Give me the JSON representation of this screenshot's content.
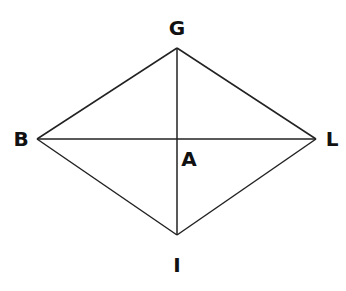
{
  "diagram": {
    "stroke_color": "#222222",
    "points": {
      "G": {
        "label": "G",
        "x": 177,
        "y": 48,
        "label_x": 177,
        "label_y": 35
      },
      "B": {
        "label": "B",
        "x": 37,
        "y": 139,
        "label_x": 21,
        "label_y": 146
      },
      "L": {
        "label": "L",
        "x": 316,
        "y": 139,
        "label_x": 332,
        "label_y": 146
      },
      "I": {
        "label": "I",
        "x": 177,
        "y": 235,
        "label_x": 177,
        "label_y": 272
      },
      "A": {
        "label": "A",
        "x": 177,
        "y": 139,
        "label_x": 189,
        "label_y": 166
      }
    },
    "edges": [
      [
        "B",
        "G"
      ],
      [
        "G",
        "L"
      ],
      [
        "L",
        "I"
      ],
      [
        "I",
        "B"
      ],
      [
        "B",
        "L"
      ],
      [
        "G",
        "I"
      ]
    ]
  }
}
